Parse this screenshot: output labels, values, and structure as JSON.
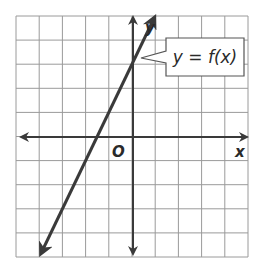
{
  "chart_data": {
    "type": "line",
    "title": "",
    "xlabel": "x",
    "ylabel": "y",
    "origin_label": "O",
    "xlim": [
      -5,
      5
    ],
    "ylim": [
      -5,
      5
    ],
    "grid": true,
    "grid_step": 1,
    "series": [
      {
        "name": "y = f(x)",
        "equation": "y = 2x + 3",
        "slope": 2,
        "intercept": 3,
        "points": [
          [
            -4,
            -5
          ],
          [
            -1.5,
            0
          ],
          [
            0,
            3
          ],
          [
            1,
            5
          ]
        ],
        "arrows": "both"
      }
    ],
    "annotations": [
      {
        "text": "y = f(x)",
        "type": "callout",
        "points_to": [
          0,
          3
        ]
      }
    ]
  },
  "labels": {
    "x_axis": "x",
    "y_axis": "y",
    "origin": "O",
    "callout": "y = f(x)"
  },
  "colors": {
    "grid": "#9a9a9a",
    "axis": "#3a3a3a",
    "line": "#3a3a3a",
    "callout_border": "#555555"
  }
}
